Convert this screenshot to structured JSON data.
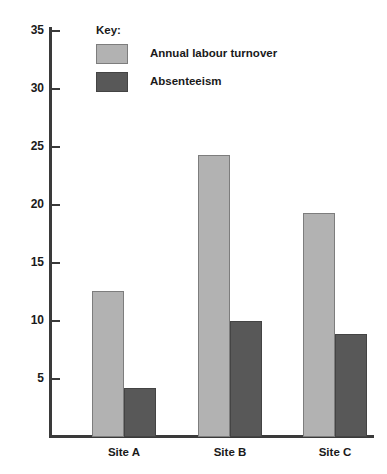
{
  "chart_data": {
    "type": "bar",
    "title": "",
    "xlabel": "",
    "ylabel": "",
    "categories": [
      "Site A",
      "Site B",
      "Site C"
    ],
    "series": [
      {
        "name": "Annual labour turnover",
        "color": "#b2b2b2",
        "values": [
          12.6,
          24.3,
          19.3
        ]
      },
      {
        "name": "Absenteeism",
        "color": "#585858",
        "values": [
          4.2,
          10.0,
          8.9
        ]
      }
    ],
    "ylim": [
      0,
      36.5
    ],
    "yticks": [
      5,
      10,
      15,
      20,
      25,
      30,
      35
    ],
    "ytick_labels": [
      "5",
      "10",
      "15",
      "20",
      "25",
      "30",
      "35"
    ],
    "grid": false,
    "legend_position": "top-left",
    "legend_title": "Key:"
  },
  "legend": {
    "title": "Key:",
    "entries": [
      {
        "label": "Annual labour turnover",
        "color": "#b2b2b2"
      },
      {
        "label": "Absenteeism",
        "color": "#585858"
      }
    ]
  },
  "axes": {
    "y_tick_labels": [
      "35",
      "30",
      "25",
      "20",
      "15",
      "10",
      "5"
    ],
    "x_tick_labels": [
      "Site A",
      "Site B",
      "Site C"
    ]
  },
  "colors": {
    "series_light": "#b2b2b2",
    "series_dark": "#585858",
    "axis": "#3a3a3a",
    "background": "#ffffff"
  }
}
